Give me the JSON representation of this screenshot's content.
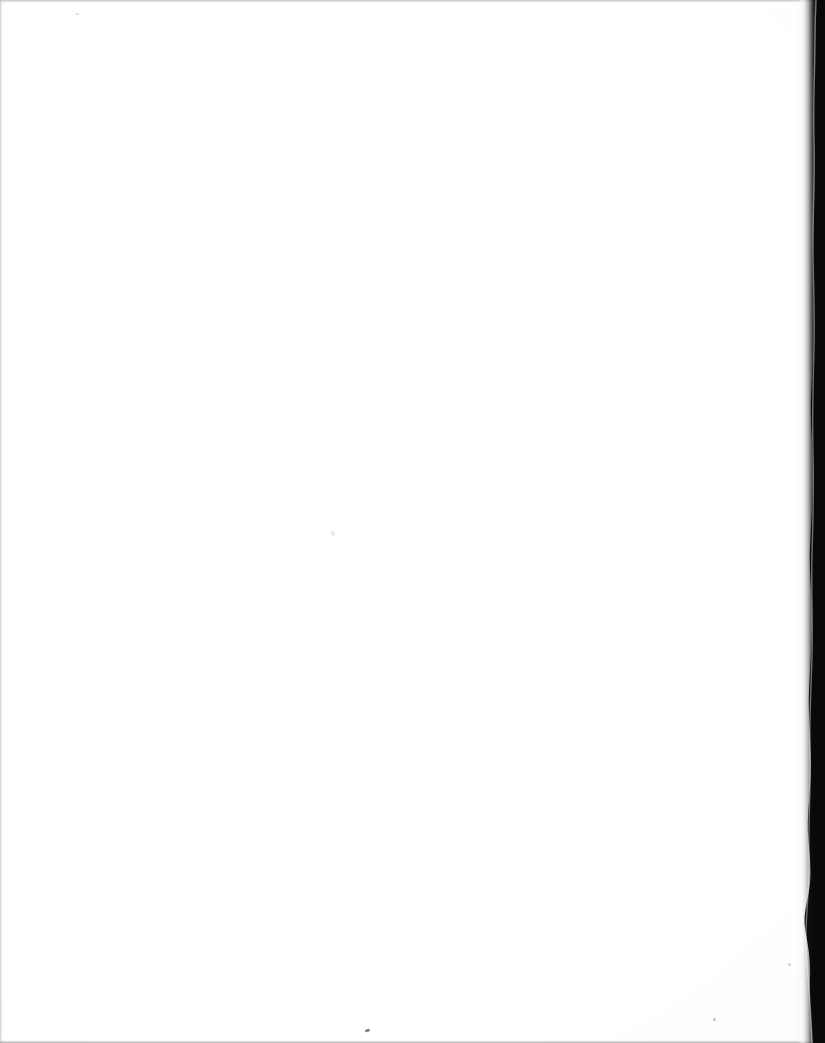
{
  "page": {
    "kind": "scanned-blank-page",
    "width": 825,
    "height": 1043,
    "visible_text": "",
    "background_color": "#ffffff"
  },
  "artifacts": {
    "gutter_shadow": {
      "name": "binding-gutter-shadow",
      "side": "right",
      "color": "#0b0b0c",
      "approx_width_px": 30
    },
    "edges": [
      {
        "name": "top-edge-line",
        "side": "top",
        "color": "#96969a"
      },
      {
        "name": "left-edge-line",
        "side": "left",
        "color": "#a8a8ac"
      },
      {
        "name": "bottom-edge-line",
        "side": "bottom",
        "color": "#828286"
      }
    ],
    "specks": [
      {
        "name": "dust-speck-bottom-center",
        "x": 365,
        "y": 1029,
        "color": "#58585c"
      },
      {
        "name": "dust-speck-center",
        "x": 331,
        "y": 531,
        "color": "#d6d6da"
      },
      {
        "name": "dust-speck-bottom-right",
        "x": 788,
        "y": 963,
        "color": "#96969b"
      },
      {
        "name": "dust-speck-top-left",
        "x": 75,
        "y": 13,
        "color": "#cdcdd0"
      },
      {
        "name": "dust-speck-bottom-right-edge",
        "x": 713,
        "y": 1018,
        "color": "#8c8c91"
      }
    ]
  }
}
